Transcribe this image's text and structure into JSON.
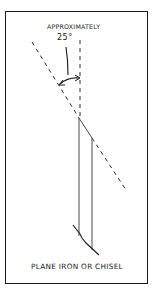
{
  "diagram": {
    "title_annotation": "APPROXIMATELY",
    "angle_label": "25°",
    "caption": "PLANE IRON OR CHISEL",
    "elements": {
      "reference_line": "vertical dashed line",
      "bevel_line": "angled dashed line",
      "blade": "plane iron / chisel outline",
      "angle_arc": "double-headed arc arrow between reference and bevel lines"
    },
    "colors": {
      "ink": "#1a1a1a",
      "background": "#ffffff"
    }
  }
}
